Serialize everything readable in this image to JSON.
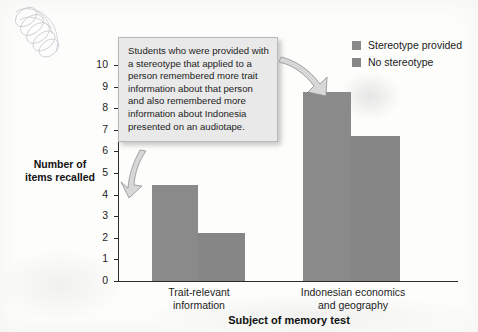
{
  "chart_data": {
    "type": "bar",
    "title": "",
    "xlabel": "Subject of memory test",
    "ylabel": "Number of items recalled",
    "ylim": [
      0,
      10
    ],
    "yticks": [
      "0",
      "1",
      "2",
      "3",
      "4",
      "5",
      "6",
      "7",
      "8",
      "9",
      "10"
    ],
    "grid": false,
    "legend_position": "top-right",
    "categories": [
      "Trait-relevant information",
      "Indonesian economics and geography"
    ],
    "series": [
      {
        "name": "Stereotype provided",
        "color": "#8a8a8a",
        "values": [
          4.45,
          8.75
        ]
      },
      {
        "name": "No stereotype",
        "color": "#868686",
        "values": [
          2.2,
          6.7
        ]
      }
    ],
    "annotations": [
      "Students who were provided with a stereotype that applied to a person remembered more trait information about that person and also remembered more information about Indonesia presented on an audiotape."
    ]
  },
  "axes": {
    "y_title_line1": "Number of",
    "y_title_line2": "items recalled",
    "x_title": "Subject of memory test",
    "yticks": [
      "10",
      "9",
      "8",
      "7",
      "6",
      "5",
      "4",
      "3",
      "2",
      "1",
      "0"
    ],
    "category_1_line1": "Trait-relevant",
    "category_1_line2": "information",
    "category_2_line1": "Indonesian economics",
    "category_2_line2": "and geography"
  },
  "legend": {
    "items": [
      {
        "label": "Stereotype provided"
      },
      {
        "label": "No stereotype"
      }
    ]
  },
  "callout": {
    "text": "Students who were provided with a stereotype that applied to a person remembered more trait information about that person and also remembered more information about Indonesia presented on an audiotape."
  }
}
